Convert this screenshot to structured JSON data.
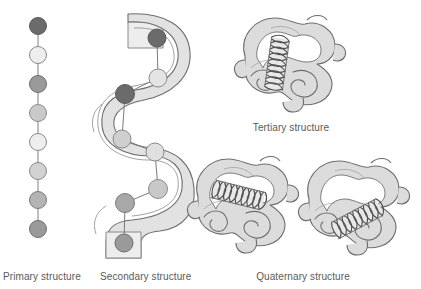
{
  "figure": {
    "background_color": "#ffffff",
    "stroke_color": "#6e6e6e",
    "label_color": "#5a5a5a"
  },
  "palette": {
    "bead_dark": "#6b6b6b",
    "bead_mid": "#9a9a9a",
    "bead_light_mid": "#c2c2c2",
    "bead_light": "#e4e4e4",
    "bead_pale": "#eeeeee",
    "ribbon_fill": "#e2e2e2",
    "ribbon_fill_light": "#ededed",
    "blob_fill": "#dcdcdc",
    "blob_fill_light": "#e8e8e8",
    "coil_fill": "#d2d2d2",
    "outline": "#6e6e6e"
  },
  "panels": [
    {
      "id": "primary",
      "label": "Primary structure",
      "label_x": 52,
      "label_y": 280
    },
    {
      "id": "secondary",
      "label": "Secondary structure",
      "label_x": 151,
      "label_y": 280
    },
    {
      "id": "tertiary",
      "label": "Tertiary structure",
      "label_x": 291,
      "label_y": 131
    },
    {
      "id": "quaternary",
      "label": "Quaternary structure",
      "label_x": 303,
      "label_y": 280
    }
  ],
  "primary_chain": {
    "bead_count": 8,
    "center_x": 38,
    "bead_radius": 8.5,
    "beads": [
      {
        "index": 1,
        "cx": 38,
        "cy": 26,
        "fill": "#6b6b6b"
      },
      {
        "index": 2,
        "cx": 38,
        "cy": 55,
        "fill": "#eeeeee"
      },
      {
        "index": 3,
        "cx": 38,
        "cy": 84,
        "fill": "#9a9a9a"
      },
      {
        "index": 4,
        "cx": 38,
        "cy": 113,
        "fill": "#c9c9c9"
      },
      {
        "index": 5,
        "cx": 38,
        "cy": 142,
        "fill": "#eeeeee"
      },
      {
        "index": 6,
        "cx": 38,
        "cy": 171,
        "fill": "#d2d2d2"
      },
      {
        "index": 7,
        "cx": 38,
        "cy": 200,
        "fill": "#b4b4b4"
      },
      {
        "index": 8,
        "cx": 38,
        "cy": 229,
        "fill": "#9a9a9a"
      }
    ]
  },
  "secondary_helix": {
    "bead_count": 8,
    "beads": [
      {
        "index": 1,
        "cx": 157,
        "cy": 38,
        "r": 9,
        "fill": "#6b6b6b"
      },
      {
        "index": 2,
        "cx": 158,
        "cy": 78,
        "r": 9,
        "fill": "#e4e4e4"
      },
      {
        "index": 3,
        "cx": 125,
        "cy": 94,
        "r": 9.5,
        "fill": "#6b6b6b"
      },
      {
        "index": 4,
        "cx": 122,
        "cy": 139,
        "r": 9,
        "fill": "#cfcfcf"
      },
      {
        "index": 5,
        "cx": 155,
        "cy": 152,
        "r": 9,
        "fill": "#e0e0e0"
      },
      {
        "index": 6,
        "cx": 158,
        "cy": 189,
        "r": 9.5,
        "fill": "#c8c8c8"
      },
      {
        "index": 7,
        "cx": 125,
        "cy": 203,
        "r": 9.5,
        "fill": "#a8a8a8"
      },
      {
        "index": 8,
        "cx": 124,
        "cy": 243,
        "r": 9,
        "fill": "#9a9a9a"
      }
    ]
  },
  "structures": [
    {
      "id": "tertiary-blob",
      "label": "Tertiary structure",
      "center_x": 291,
      "center_y": 62
    },
    {
      "id": "quaternary-blob-a",
      "label": "Quaternary subunit A",
      "center_x": 244,
      "center_y": 203
    },
    {
      "id": "quaternary-blob-b",
      "label": "Quaternary subunit B",
      "center_x": 355,
      "center_y": 205
    }
  ]
}
